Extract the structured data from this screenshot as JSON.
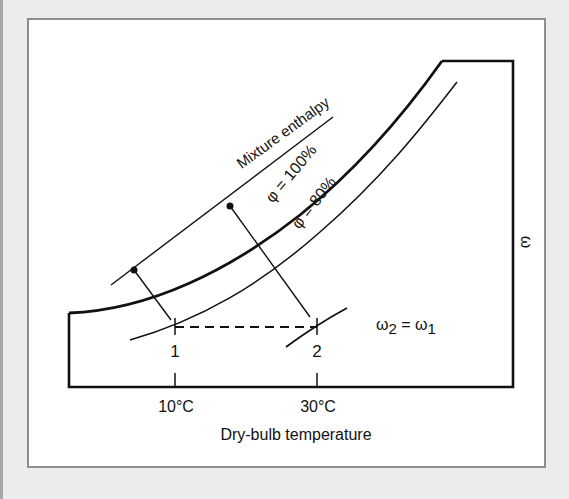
{
  "diagram": {
    "type": "psychrometric-chart-sketch",
    "labels": {
      "enthalpy_line": "Mixture enthalpy",
      "saturation_curve": "φ = 100%",
      "rh80_curve": "φ = 80%",
      "y_axis": "ω",
      "humidity_relation": "ω2 = ω1",
      "humidity_relation_parts": {
        "omega": "ω",
        "sub2": "2",
        "equals": " = ",
        "sub1": "1"
      },
      "state_1": "1",
      "state_2": "2",
      "x_axis": "Dry-bulb temperature",
      "x_ticks": [
        "10°C",
        "30°C"
      ]
    },
    "states": [
      {
        "id": "1",
        "temperature": "10°C",
        "relative_humidity": "80%"
      },
      {
        "id": "2",
        "temperature": "30°C"
      }
    ],
    "process": "Sensible heating at constant humidity ratio (ω2 = ω1)",
    "colors": {
      "background": "#ececec",
      "panel": "#ffffff",
      "panel_border": "#8e8e8e",
      "ink": "#111111"
    }
  }
}
